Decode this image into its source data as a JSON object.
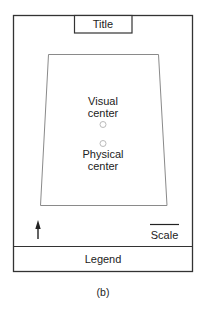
{
  "diagram": {
    "title": "Title",
    "visual_center_label": [
      "Visual",
      "center"
    ],
    "physical_center_label": [
      "Physical",
      "center"
    ],
    "scale_label": "Scale",
    "legend_label": "Legend",
    "caption": "(b)",
    "north_arrow": "north-arrow",
    "colors": {
      "frame": "#333333",
      "trapezoid": "#888888",
      "circle": "#bbbbbb",
      "text": "#222222"
    }
  }
}
